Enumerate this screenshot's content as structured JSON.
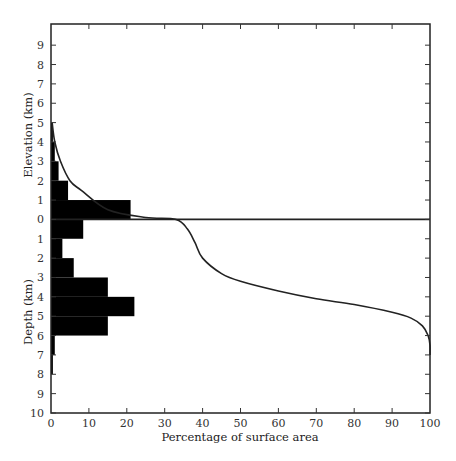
{
  "chart_data": {
    "type": "bar",
    "subtype": "horizontal-histogram-with-hypsometric-curve",
    "title": "",
    "xlabel": "Percentage of surface area",
    "ylabel_upper": "Elevation (km)",
    "ylabel_lower": "Depth (km)",
    "xlim": [
      0,
      100
    ],
    "x_ticks": [
      "0",
      "10",
      "20",
      "30",
      "40",
      "50",
      "60",
      "70",
      "80",
      "90",
      "100"
    ],
    "y_ticks_elevation": [
      "9",
      "8",
      "7",
      "6",
      "5",
      "4",
      "3",
      "2",
      "1",
      "0"
    ],
    "y_ticks_depth": [
      "1",
      "2",
      "3",
      "4",
      "5",
      "6",
      "7",
      "8",
      "9",
      "10"
    ],
    "ylim_km": [
      -10,
      10
    ],
    "grid": false,
    "legend": null,
    "histogram": {
      "categories": [
        "Elev 4-5",
        "Elev 3-4",
        "Elev 2-3",
        "Elev 1-2",
        "Elev 0-1",
        "Depth 0-1",
        "Depth 1-2",
        "Depth 2-3",
        "Depth 3-4",
        "Depth 4-5",
        "Depth 5-6",
        "Depth 6-7",
        "Depth 7-8"
      ],
      "bins_km": [
        [
          4,
          5
        ],
        [
          3,
          4
        ],
        [
          2,
          3
        ],
        [
          1,
          2
        ],
        [
          0,
          1
        ],
        [
          -1,
          0
        ],
        [
          -2,
          -1
        ],
        [
          -3,
          -2
        ],
        [
          -4,
          -3
        ],
        [
          -5,
          -4
        ],
        [
          -6,
          -5
        ],
        [
          -7,
          -6
        ],
        [
          -8,
          -7
        ]
      ],
      "values": [
        0.5,
        1,
        2,
        4.5,
        21,
        8.5,
        3,
        6,
        15,
        22,
        15,
        1,
        0.5
      ]
    },
    "hypsometric_curve": {
      "x_percent": [
        0.3,
        1,
        2.5,
        5,
        8,
        15,
        25,
        33,
        36,
        38,
        40,
        45,
        50,
        60,
        70,
        80,
        90,
        95,
        98,
        99.5,
        100,
        100
      ],
      "y_km": [
        5,
        4,
        3,
        2,
        1.5,
        0.5,
        0.1,
        0,
        -0.5,
        -1.2,
        -2,
        -2.8,
        -3.2,
        -3.7,
        -4.1,
        -4.4,
        -4.8,
        -5.1,
        -5.5,
        -6,
        -6.5,
        -7
      ]
    },
    "sea_level_line": {
      "y_km": 0,
      "x_range": [
        0,
        100
      ]
    }
  }
}
